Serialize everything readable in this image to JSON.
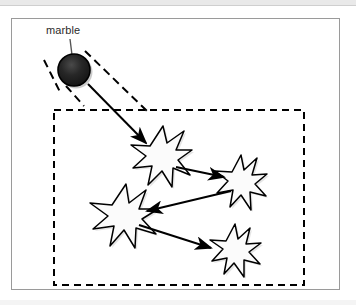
{
  "figure": {
    "labels": [
      {
        "id": "marble",
        "text": "marble"
      }
    ],
    "colors": {
      "frame_border": "#9a9a9a",
      "background": "#ffffff",
      "ink": "#000000",
      "marble_fill": "#1c1c1c",
      "marble_edge": "#000000",
      "star_fill": "#fbfbfb",
      "star_edge": "#000000",
      "shadow": "#bdbdbd",
      "top_band": "#e9e9e9",
      "label_text": "#2b2b2b"
    },
    "frame": {
      "x": 11,
      "y": 18,
      "width": 329,
      "height": 272
    },
    "dashed_region": {
      "x": 54,
      "y": 110,
      "width": 250,
      "height": 175,
      "dash": "7 5"
    },
    "marble": {
      "cx": 74,
      "cy": 70,
      "r": 16
    },
    "leader_line": {
      "x1": 70,
      "y1": 40,
      "x2": 72,
      "y2": 54
    },
    "trajectory_dashes": [
      {
        "x1": 85,
        "y1": 52,
        "x2": 146,
        "y2": 112
      },
      {
        "x1": 45,
        "y1": 61,
        "x2": 60,
        "y2": 110
      }
    ],
    "stars": [
      {
        "id": "star-1",
        "cx": 161,
        "cy": 155,
        "r": 27
      },
      {
        "id": "star-2",
        "cx": 240,
        "cy": 180,
        "r": 25
      },
      {
        "id": "star-3",
        "cx": 122,
        "cy": 215,
        "r": 29
      },
      {
        "id": "star-4",
        "cx": 233,
        "cy": 248,
        "r": 24
      }
    ],
    "arrows": [
      {
        "id": "arrow-marble-to-star-1",
        "x1": 88,
        "y1": 84,
        "x2": 145,
        "y2": 142
      },
      {
        "id": "arrow-star-1-to-star-2",
        "x1": 177,
        "y1": 168,
        "x2": 222,
        "y2": 176
      },
      {
        "id": "arrow-star-2-to-star-3",
        "x1": 229,
        "y1": 192,
        "x2": 148,
        "y2": 211
      },
      {
        "id": "arrow-star-3-to-star-4",
        "x1": 140,
        "y1": 226,
        "x2": 209,
        "y2": 247
      }
    ]
  }
}
